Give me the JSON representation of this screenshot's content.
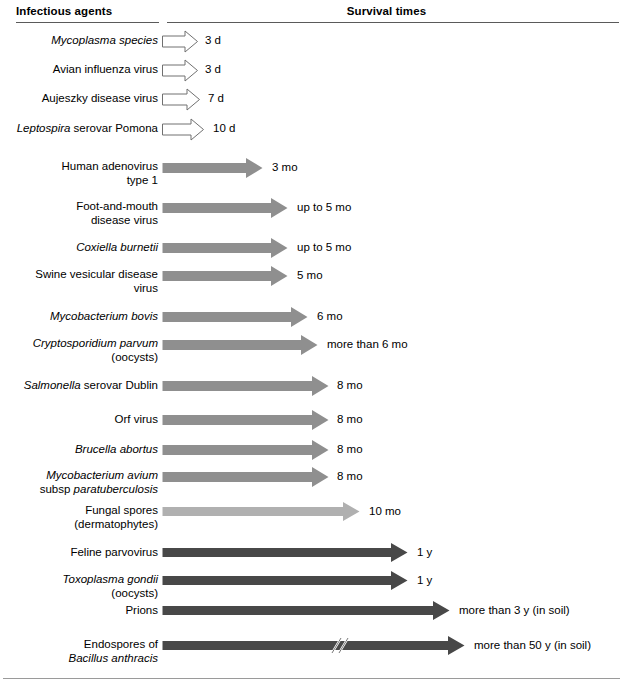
{
  "header": {
    "col_agents": "Infectious agents",
    "col_survival": "Survival times"
  },
  "chart_data": {
    "type": "bar",
    "xlabel": "Survival times",
    "ylabel": "Infectious agents",
    "orientation": "horizontal",
    "categories": [
      "Mycoplasma species",
      "Avian influenza virus",
      "Aujeszky disease virus",
      "Leptospira serovar Pomona",
      "Human adenovirus type 1",
      "Foot-and-mouth disease virus",
      "Coxiella burnetii",
      "Swine vesicular disease virus",
      "Mycobacterium bovis",
      "Cryptosporidium parvum (oocysts)",
      "Salmonella serovar Dublin",
      "Orf virus",
      "Brucella abortus",
      "Mycobacterium avium subsp paratuberculosis",
      "Fungal spores (dermatophytes)",
      "Feline parvovirus",
      "Toxoplasma gondii (oocysts)",
      "Prions",
      "Endospores of Bacillus anthracis"
    ],
    "value_labels": [
      "3 d",
      "3 d",
      "7 d",
      "10 d",
      "3 mo",
      "up to 5 mo",
      "up to 5 mo",
      "5 mo",
      "6 mo",
      "more than 6 mo",
      "8 mo",
      "8 mo",
      "8 mo",
      "8 mo",
      "10 mo",
      "1 y",
      "1 y",
      "more than 3 y (in soil)",
      "more than 50 y (in soil)"
    ],
    "values_days": [
      3,
      3,
      7,
      10,
      90,
      150,
      150,
      150,
      180,
      180,
      240,
      240,
      240,
      240,
      300,
      365,
      365,
      1095,
      18250
    ],
    "units": [
      "d",
      "d",
      "d",
      "d",
      "mo",
      "mo",
      "mo",
      "mo",
      "mo",
      "mo",
      "mo",
      "mo",
      "mo",
      "mo",
      "mo",
      "y",
      "y",
      "y",
      "y"
    ],
    "grid": false,
    "legend": null
  },
  "rows": [
    {
      "label_lines": [
        "Mycoplasma species"
      ],
      "label_italic": [
        true
      ],
      "value": "3 d",
      "style": "open",
      "top": 34,
      "arrow_end": 198,
      "value_x": 205
    },
    {
      "label_lines": [
        "Avian influenza virus"
      ],
      "label_italic": [
        false
      ],
      "value": "3 d",
      "style": "open",
      "top": 63,
      "arrow_end": 198,
      "value_x": 205
    },
    {
      "label_lines": [
        "Aujeszky disease virus"
      ],
      "label_italic": [
        false
      ],
      "value": "7 d",
      "style": "open",
      "top": 92,
      "arrow_end": 200,
      "value_x": 208
    },
    {
      "label_lines": [
        "Leptospira serovar Pomona"
      ],
      "label_italic": [
        "mixed-leptospira"
      ],
      "value": "10 d",
      "style": "open",
      "top": 122,
      "arrow_end": 204,
      "value_x": 213
    },
    {
      "label_lines": [
        "Human adenovirus",
        "type 1"
      ],
      "label_italic": [
        false,
        false
      ],
      "value": "3 mo",
      "style": "mid",
      "top": 161,
      "arrow_end": 263,
      "value_x": 272
    },
    {
      "label_lines": [
        "Foot-and-mouth",
        "disease virus"
      ],
      "label_italic": [
        false,
        false
      ],
      "value": "up to 5 mo",
      "style": "mid",
      "top": 201,
      "arrow_end": 288,
      "value_x": 297
    },
    {
      "label_lines": [
        "Coxiella burnetii"
      ],
      "label_italic": [
        true
      ],
      "value": "up to 5 mo",
      "style": "mid",
      "top": 241,
      "arrow_end": 288,
      "value_x": 297
    },
    {
      "label_lines": [
        "Swine vesicular disease",
        "virus"
      ],
      "label_italic": [
        false,
        false
      ],
      "value": "5 mo",
      "style": "mid",
      "top": 269,
      "arrow_end": 288,
      "value_x": 297
    },
    {
      "label_lines": [
        "Mycobacterium bovis"
      ],
      "label_italic": [
        true
      ],
      "value": "6 mo",
      "style": "mid",
      "top": 310,
      "arrow_end": 308,
      "value_x": 317
    },
    {
      "label_lines": [
        "Cryptosporidium parvum",
        "(oocysts)"
      ],
      "label_italic": [
        true,
        false
      ],
      "value": "more than 6 mo",
      "style": "mid",
      "top": 338,
      "arrow_end": 318,
      "value_x": 327
    },
    {
      "label_lines": [
        "Salmonella serovar Dublin"
      ],
      "label_italic": [
        "mixed-salmonella"
      ],
      "value": "8 mo",
      "style": "mid",
      "top": 379,
      "arrow_end": 329,
      "value_x": 337
    },
    {
      "label_lines": [
        "Orf virus"
      ],
      "label_italic": [
        false
      ],
      "value": "8 mo",
      "style": "mid",
      "top": 413,
      "arrow_end": 329,
      "value_x": 337
    },
    {
      "label_lines": [
        "Brucella abortus"
      ],
      "label_italic": [
        true
      ],
      "value": "8 mo",
      "style": "mid",
      "top": 443,
      "arrow_end": 329,
      "value_x": 337
    },
    {
      "label_lines": [
        "Mycobacterium avium",
        "subsp paratuberculosis"
      ],
      "label_italic": [
        true,
        "mixed-subsp"
      ],
      "value": "8 mo",
      "style": "mid",
      "top": 470,
      "arrow_end": 329,
      "value_x": 337
    },
    {
      "label_lines": [
        "Fungal spores",
        "(dermatophytes)"
      ],
      "label_italic": [
        false,
        false
      ],
      "value": "10 mo",
      "style": "light",
      "top": 505,
      "arrow_end": 360,
      "value_x": 369
    },
    {
      "label_lines": [
        "Feline parvovirus"
      ],
      "label_italic": [
        false
      ],
      "value": "1 y",
      "style": "dark",
      "top": 546,
      "arrow_end": 408,
      "value_x": 417
    },
    {
      "label_lines": [
        "Toxoplasma gondii",
        "(oocysts)"
      ],
      "label_italic": [
        true,
        false
      ],
      "value": "1 y",
      "style": "dark",
      "top": 574,
      "arrow_end": 408,
      "value_x": 417
    },
    {
      "label_lines": [
        "Prions"
      ],
      "label_italic": [
        false
      ],
      "value": "more than 3 y (in soil)",
      "style": "dark",
      "top": 604,
      "arrow_end": 450,
      "value_x": 459
    },
    {
      "label_lines": [
        "Endospores of",
        "Bacillus anthracis"
      ],
      "label_italic": [
        false,
        true
      ],
      "value": "more than 50 y (in soil)",
      "style": "dark",
      "top": 639,
      "arrow_end": 465,
      "value_x": 474,
      "break_mark": true
    }
  ],
  "colors": {
    "open_stroke": "#707070",
    "open_fill": "#ffffff",
    "light_gray": "#b0b0b0",
    "mid_gray": "#8f8f8f",
    "dark_gray": "#484848",
    "rule": "#5a5a5a",
    "text": "#000000"
  }
}
